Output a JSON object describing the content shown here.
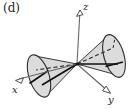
{
  "figure": {
    "panel_label": "(d)",
    "caption_position": "top-left",
    "background_color": "#ffffff"
  },
  "axes": {
    "z": {
      "label": "z",
      "direction": "up",
      "arrow": "open-triangle",
      "apex": [
        77,
        64
      ],
      "tip": [
        80,
        7
      ]
    },
    "x": {
      "label": "x",
      "direction": "lower-left",
      "arrow": "open-triangle",
      "apex": [
        77,
        64
      ],
      "tip": [
        16,
        81
      ]
    },
    "y": {
      "label": "y",
      "direction": "lower-right",
      "arrow": "open-triangle",
      "apex": [
        77,
        64
      ],
      "tip": [
        110,
        93
      ]
    }
  },
  "cones": {
    "left": {
      "name": "left-nappe",
      "apex": [
        77,
        64
      ],
      "base_center": [
        39,
        76
      ],
      "base_rx": 10,
      "base_ry": 22,
      "base_rotation_deg": -18,
      "fill": "#d6d6d6",
      "stroke": "#3a3a3a"
    },
    "right": {
      "name": "right-nappe",
      "apex": [
        77,
        64
      ],
      "base_center": [
        114,
        56
      ],
      "base_rx": 10,
      "base_ry": 22,
      "base_rotation_deg": -16,
      "fill": "#d6d6d6",
      "stroke": "#3a3a3a"
    }
  },
  "colors": {
    "cone_fill": "#d6d6d6",
    "cone_fill_light": "#e4e4e4",
    "outline": "#3a3a3a",
    "axis_line": "#555555",
    "solid_chord": "#101010",
    "dashed_chord": "#2a2a2a",
    "text": "#1a1a1a"
  },
  "guides": {
    "solid_chord_label": "major-axis-solid",
    "dashed_chord_label": "minor-axis-dashed"
  }
}
